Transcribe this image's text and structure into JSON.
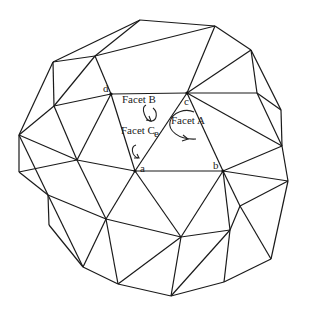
{
  "diagram": {
    "type": "geodesic-triangulated-mesh",
    "stroke_color": "#1a1a1a",
    "background": "#ffffff",
    "vertices": {
      "T1": [
        140,
        20
      ],
      "T2": [
        215,
        26
      ],
      "T3": [
        251,
        50
      ],
      "U1": [
        53,
        62
      ],
      "U2": [
        95,
        56
      ],
      "d": [
        111,
        94
      ],
      "c": [
        187,
        93
      ],
      "R1": [
        257,
        93
      ],
      "L1": [
        19,
        135
      ],
      "L2": [
        54,
        106
      ],
      "M1": [
        77,
        160
      ],
      "a": [
        135,
        171
      ],
      "b": [
        223,
        171
      ],
      "R2": [
        281,
        110
      ],
      "R3": [
        282,
        146
      ],
      "R4": [
        288,
        181
      ],
      "R5": [
        240,
        206
      ],
      "R6": [
        271,
        259
      ],
      "L3": [
        19,
        172
      ],
      "L4": [
        48,
        195
      ],
      "L5": [
        49,
        225
      ],
      "M2": [
        106,
        219
      ],
      "M3": [
        181,
        237
      ],
      "M4": [
        230,
        230
      ],
      "B1": [
        83,
        267
      ],
      "B2": [
        118,
        284
      ],
      "B3": [
        171,
        296
      ],
      "B4": [
        224,
        282
      ]
    },
    "edges": [
      [
        "T1",
        "T2"
      ],
      [
        "T2",
        "T3"
      ],
      [
        "T1",
        "U2"
      ],
      [
        "U2",
        "U1"
      ],
      [
        "U1",
        "L2"
      ],
      [
        "T1",
        "U1"
      ],
      [
        "T2",
        "U2"
      ],
      [
        "U2",
        "d"
      ],
      [
        "T3",
        "c"
      ],
      [
        "T3",
        "R1"
      ],
      [
        "T2",
        "c"
      ],
      [
        "T3",
        "R2"
      ],
      [
        "U1",
        "L1"
      ],
      [
        "L2",
        "L1"
      ],
      [
        "L2",
        "d"
      ],
      [
        "U2",
        "L2"
      ],
      [
        "d",
        "c"
      ],
      [
        "c",
        "R1"
      ],
      [
        "R1",
        "R2"
      ],
      [
        "R1",
        "R3"
      ],
      [
        "R2",
        "R3"
      ],
      [
        "d",
        "a"
      ],
      [
        "d",
        "M1"
      ],
      [
        "c",
        "a"
      ],
      [
        "c",
        "b"
      ],
      [
        "a",
        "b"
      ],
      [
        "c",
        "R3"
      ],
      [
        "b",
        "R3"
      ],
      [
        "R3",
        "R4"
      ],
      [
        "b",
        "R4"
      ],
      [
        "L2",
        "M1"
      ],
      [
        "L1",
        "M1"
      ],
      [
        "M1",
        "a"
      ],
      [
        "L1",
        "L3"
      ],
      [
        "L3",
        "M1"
      ],
      [
        "L3",
        "L4"
      ],
      [
        "L1",
        "L4"
      ],
      [
        "L4",
        "M2"
      ],
      [
        "M1",
        "M2"
      ],
      [
        "a",
        "M2"
      ],
      [
        "L4",
        "L5"
      ],
      [
        "L5",
        "B1"
      ],
      [
        "L4",
        "B1"
      ],
      [
        "M2",
        "B1"
      ],
      [
        "M2",
        "B2"
      ],
      [
        "B1",
        "B2"
      ],
      [
        "B2",
        "B3"
      ],
      [
        "M2",
        "M3"
      ],
      [
        "a",
        "M3"
      ],
      [
        "b",
        "M3"
      ],
      [
        "M3",
        "B2"
      ],
      [
        "M3",
        "B3"
      ],
      [
        "b",
        "R5"
      ],
      [
        "R4",
        "R5"
      ],
      [
        "R5",
        "M4"
      ],
      [
        "M3",
        "M4"
      ],
      [
        "M4",
        "B3"
      ],
      [
        "M4",
        "B4"
      ],
      [
        "B3",
        "B4"
      ],
      [
        "B4",
        "R6"
      ],
      [
        "R5",
        "R6"
      ],
      [
        "R4",
        "R6"
      ],
      [
        "b",
        "M4"
      ]
    ],
    "labeled_vertices": [
      {
        "id": "d",
        "text": "d",
        "dx": -8,
        "dy": -2
      },
      {
        "id": "c",
        "text": "c",
        "dx": -3,
        "dy": 12
      },
      {
        "id": "a",
        "text": "a",
        "dx": 5,
        "dy": 1
      },
      {
        "id": "b",
        "text": "b",
        "dx": -10,
        "dy": -2
      }
    ],
    "facet_labels": [
      {
        "text": "Facet A",
        "x": 171,
        "y": 124
      },
      {
        "text": "Facet B",
        "x": 122,
        "y": 103
      },
      {
        "text": "Facet C",
        "x": 121,
        "y": 134
      },
      {
        "text": "e",
        "x": 154,
        "y": 137
      }
    ]
  }
}
